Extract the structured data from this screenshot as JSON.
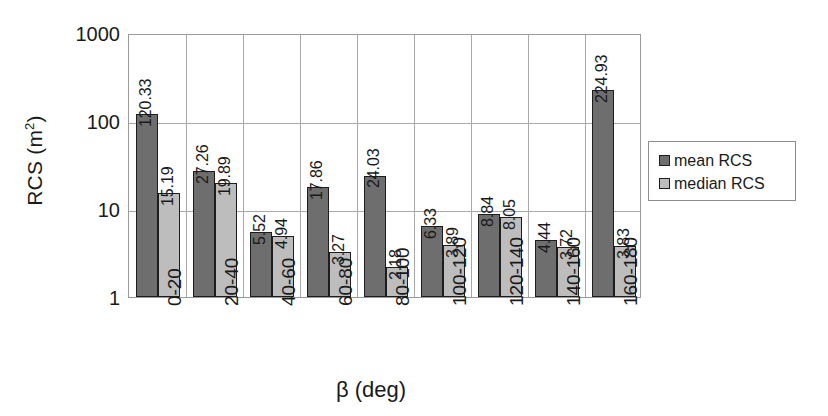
{
  "chart_data": {
    "type": "bar",
    "title": "",
    "xlabel": "β (deg)",
    "ylabel": "RCS (m2)",
    "ylabel_base": "RCS (m",
    "ylabel_sup": "2",
    "ylabel_tail": ")",
    "yscale": "log",
    "ylim": [
      1,
      1000
    ],
    "ytick_labels": [
      "1000",
      "100",
      "10",
      "1"
    ],
    "ytick_values": [
      1000,
      100,
      10,
      1
    ],
    "grid": true,
    "legend_position": "right",
    "categories": [
      "0-20",
      "20-40",
      "40-60",
      "60-80",
      "80-100",
      "100-120",
      "120-140",
      "140-160",
      "160-180"
    ],
    "series": [
      {
        "name": "mean RCS",
        "color": "#6e6e6e",
        "values": [
          120.33,
          27.26,
          5.52,
          17.86,
          24.03,
          6.33,
          8.84,
          4.44,
          224.93
        ],
        "labels": [
          "120.33",
          "27.26",
          "5.52",
          "17.86",
          "24.03",
          "6.33",
          "8.84",
          "4.44",
          "224.93"
        ]
      },
      {
        "name": "median RCS",
        "color": "#bdbdbd",
        "values": [
          15.19,
          19.89,
          4.94,
          3.27,
          2.18,
          3.89,
          8.05,
          3.72,
          3.83
        ],
        "labels": [
          "15.19",
          "19.89",
          "4.94",
          "3.27",
          "2.18",
          "3.89",
          "8.05",
          "3.72",
          "3.83"
        ]
      }
    ]
  },
  "legend": {
    "items": [
      {
        "label": "mean RCS",
        "swatch": "mean"
      },
      {
        "label": "median RCS",
        "swatch": "median"
      }
    ]
  }
}
